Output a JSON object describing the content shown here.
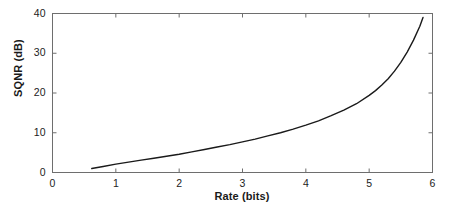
{
  "chart_data": {
    "type": "line",
    "title": "",
    "subtitle": "",
    "xlabel": "Rate (bits)",
    "ylabel": "SQNR (dB)",
    "xlim": [
      0,
      6
    ],
    "ylim": [
      0,
      40
    ],
    "xticks": [
      "0",
      "1",
      "2",
      "3",
      "4",
      "5",
      "6"
    ],
    "yticks": [
      "0",
      "10",
      "20",
      "30",
      "40"
    ],
    "xtick_values": [
      0,
      1,
      2,
      3,
      4,
      5,
      6
    ],
    "ytick_values": [
      0,
      10,
      20,
      30,
      40
    ],
    "grid": false,
    "legend": null,
    "legend_position": "none",
    "annotations": [],
    "series": [
      {
        "name": "SQNR vs Rate",
        "color": "#1a1a1a",
        "linewidth": 1.4,
        "x": [
          0.62,
          0.8,
          1.0,
          1.2,
          1.4,
          1.6,
          1.8,
          2.0,
          2.2,
          2.4,
          2.6,
          2.8,
          3.0,
          3.2,
          3.4,
          3.6,
          3.8,
          4.0,
          4.2,
          4.4,
          4.6,
          4.8,
          5.0,
          5.1,
          5.2,
          5.3,
          5.4,
          5.5,
          5.6,
          5.7,
          5.8,
          5.85
        ],
        "y": [
          1.0,
          1.5,
          2.1,
          2.6,
          3.1,
          3.6,
          4.1,
          4.6,
          5.2,
          5.8,
          6.4,
          7.0,
          7.7,
          8.4,
          9.2,
          10.0,
          10.9,
          11.9,
          13.0,
          14.3,
          15.7,
          17.3,
          19.4,
          20.6,
          22.0,
          23.6,
          25.5,
          27.7,
          30.3,
          33.3,
          36.8,
          39.0
        ]
      }
    ]
  },
  "axes": {
    "box_color": "#6e6e6e",
    "tick_color": "#6e6e6e",
    "background": "#ffffff"
  }
}
